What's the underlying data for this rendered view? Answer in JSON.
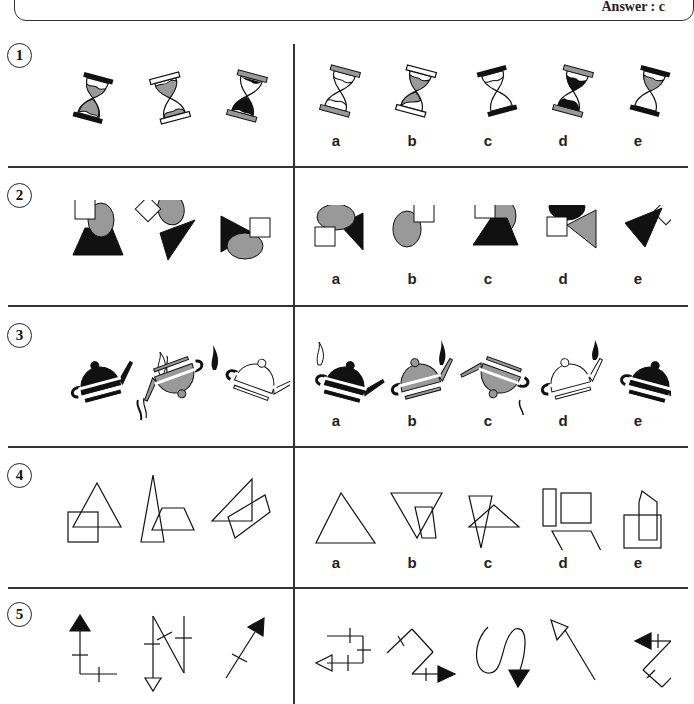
{
  "header": {
    "answer_label": "Answer : c"
  },
  "colors": {
    "black": "#111111",
    "gray": "#999999",
    "white": "#ffffff",
    "line": "#333333"
  },
  "questions": [
    {
      "number": "1",
      "subject": "hourglasses",
      "options": [
        "a",
        "b",
        "c",
        "d",
        "e"
      ]
    },
    {
      "number": "2",
      "subject": "square-ellipse-triangle",
      "options": [
        "a",
        "b",
        "c",
        "d",
        "e"
      ]
    },
    {
      "number": "3",
      "subject": "teapots",
      "options": [
        "a",
        "b",
        "c",
        "d",
        "e"
      ]
    },
    {
      "number": "4",
      "subject": "outline-polygons",
      "options": [
        "a",
        "b",
        "c",
        "d",
        "e"
      ]
    },
    {
      "number": "5",
      "subject": "arrow-paths",
      "options": [
        "a",
        "b",
        "c",
        "d",
        "e"
      ]
    }
  ]
}
